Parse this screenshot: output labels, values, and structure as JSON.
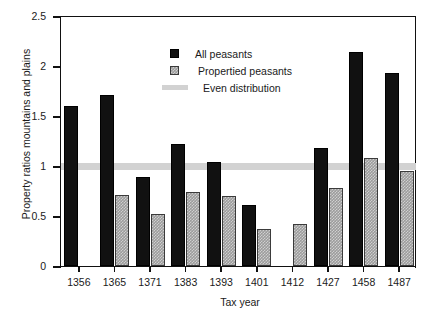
{
  "chart_data": {
    "type": "bar",
    "title": "",
    "xlabel": "Tax year",
    "ylabel": "Property ratios mountains and plains",
    "categories": [
      "1356",
      "1365",
      "1371",
      "1383",
      "1393",
      "1401",
      "1412",
      "1427",
      "1458",
      "1487"
    ],
    "series": [
      {
        "name": "All peasants",
        "color": "#111111",
        "values": [
          1.6,
          1.71,
          0.89,
          1.22,
          1.04,
          0.61,
          null,
          1.18,
          2.14,
          1.93
        ]
      },
      {
        "name": "Propertied peasants",
        "color": "#9c9c9c",
        "values": [
          null,
          0.71,
          0.52,
          0.74,
          0.7,
          0.37,
          0.42,
          0.78,
          1.08,
          0.95
        ]
      }
    ],
    "reference_line": {
      "name": "Even distribution",
      "value": 1.0,
      "color": "#d2d2d2"
    },
    "ylim": [
      0,
      2.5
    ],
    "yticks": [
      "0",
      "0.5",
      "1",
      "1.5",
      "2",
      "2.5"
    ],
    "ytick_values": [
      0,
      0.5,
      1,
      1.5,
      2,
      2.5
    ],
    "grid": false,
    "legend_position": "top-center"
  },
  "legend": {
    "items": [
      {
        "label": "All peasants",
        "swatch": "black-square-icon"
      },
      {
        "label": "Propertied peasants",
        "swatch": "gray-hatched-square-icon"
      },
      {
        "label": "Even distribution",
        "swatch": "gray-band-icon"
      }
    ]
  }
}
